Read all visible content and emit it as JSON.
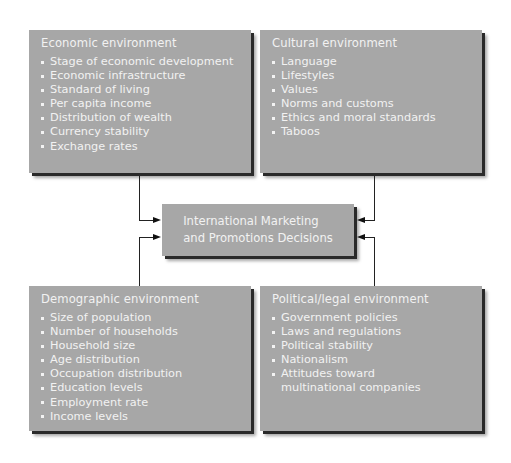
{
  "diagram": {
    "center": {
      "line1": "International Marketing",
      "line2": "and Promotions Decisions"
    },
    "boxes": {
      "economic": {
        "title": "Economic environment",
        "items": [
          "Stage of economic development",
          "Economic infrastructure",
          "Standard of living",
          "Per capita income",
          "Distribution of wealth",
          "Currency stability",
          "Exchange rates"
        ]
      },
      "cultural": {
        "title": "Cultural environment",
        "items": [
          "Language",
          "Lifestyles",
          "Values",
          "Norms and customs",
          "Ethics and moral standards",
          "Taboos"
        ]
      },
      "demographic": {
        "title": "Demographic environment",
        "items": [
          "Size of population",
          "Number of households",
          "Household size",
          "Age distribution",
          "Occupation distribution",
          "Education levels",
          "Employment rate",
          "Income levels"
        ]
      },
      "political": {
        "title": "Political/legal environment",
        "items": [
          "Government policies",
          "Laws and regulations",
          "Political stability",
          "Nationalism",
          "Attitudes toward multinational companies"
        ]
      }
    },
    "colors": {
      "box_fill": "#a7a7a7",
      "box_text": "#f2f2f2",
      "connector": "#222222"
    }
  }
}
